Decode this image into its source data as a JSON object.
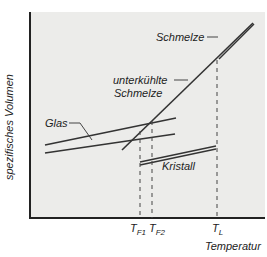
{
  "diagram": {
    "ylabel": "spezifisches Volumen",
    "xlabel": "Temperatur",
    "labels": {
      "schmelze": "Schmelze",
      "unterkuehlt_1": "unterkühlte",
      "unterkuehlt_2": "Schmelze",
      "glas": "Glas",
      "kristall": "Kristall"
    },
    "ticks": [
      {
        "main": "T",
        "sub": "F1"
      },
      {
        "main": "T",
        "sub": "F2"
      },
      {
        "main": "T",
        "sub": "L"
      }
    ]
  }
}
